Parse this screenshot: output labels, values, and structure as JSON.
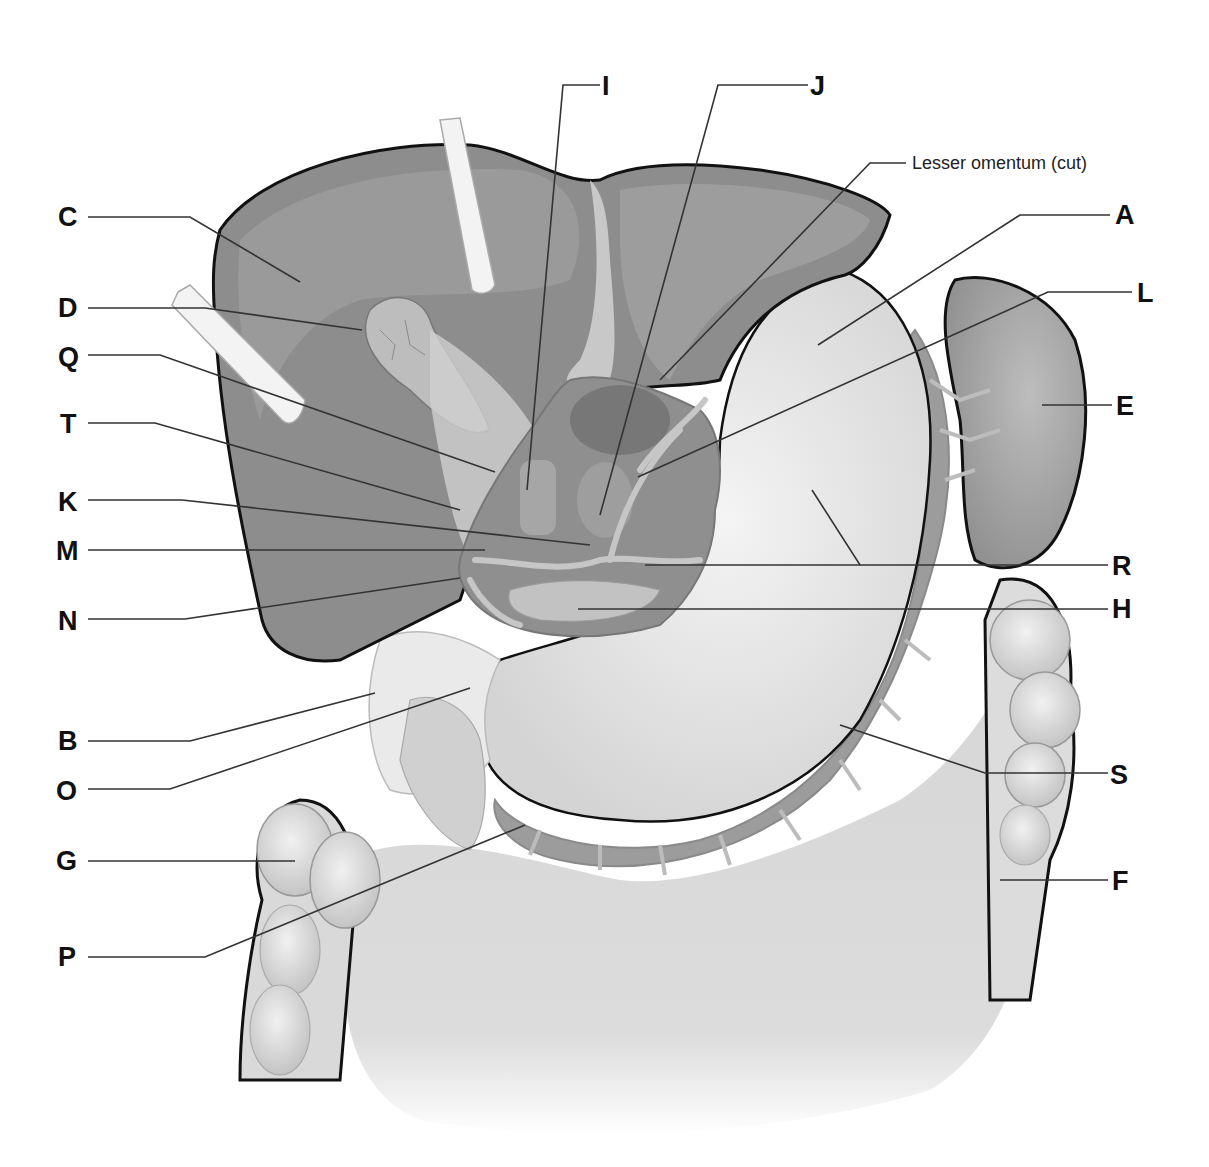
{
  "diagram": {
    "colors": {
      "liver": "#8f8f8f",
      "liver_dark": "#7a7a7a",
      "stomach": "#e6e6e6",
      "spleen": "#a9a9a9",
      "omentum": "#d2d2d2",
      "colon": "#dedede",
      "vessel": "#9a9a9a",
      "outline": "#111111",
      "leader": "#333333",
      "retractor": "#f2f2f2"
    }
  },
  "labels": {
    "A": "A",
    "B": "B",
    "C": "C",
    "D": "D",
    "E": "E",
    "F": "F",
    "G": "G",
    "H": "H",
    "I": "I",
    "J": "J",
    "K": "K",
    "L": "L",
    "M": "M",
    "N": "N",
    "O": "O",
    "P": "P",
    "Q": "Q",
    "R": "R",
    "S": "S",
    "T": "T",
    "lesser_omentum": "Lesser omentum (cut)"
  }
}
